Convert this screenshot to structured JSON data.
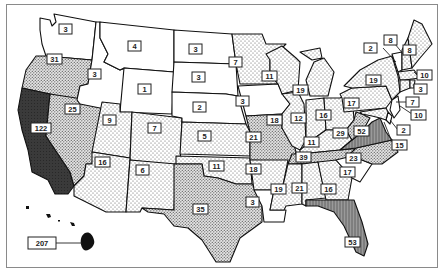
{
  "map": {
    "type": "choropleth",
    "region": "United States",
    "shading_levels": {
      "none": "#ffffff",
      "light": "light dots",
      "medium": "dense dots",
      "dark": "#8a8a8a",
      "darkest": "#333333"
    },
    "states": [
      {
        "abbr": "WA",
        "value": "3"
      },
      {
        "abbr": "OR",
        "value": "31"
      },
      {
        "abbr": "CA",
        "value": "122"
      },
      {
        "abbr": "NV",
        "value": "25"
      },
      {
        "abbr": "ID",
        "value": "3"
      },
      {
        "abbr": "MT",
        "value": "4"
      },
      {
        "abbr": "WY",
        "value": "1"
      },
      {
        "abbr": "UT",
        "value": "9"
      },
      {
        "abbr": "CO",
        "value": "7"
      },
      {
        "abbr": "AZ",
        "value": "16"
      },
      {
        "abbr": "NM",
        "value": "6"
      },
      {
        "abbr": "ND",
        "value": "3"
      },
      {
        "abbr": "SD",
        "value": "3"
      },
      {
        "abbr": "NE",
        "value": "2"
      },
      {
        "abbr": "KS",
        "value": "5"
      },
      {
        "abbr": "OK",
        "value": "11"
      },
      {
        "abbr": "TX",
        "value": "35"
      },
      {
        "abbr": "MN",
        "value": "7"
      },
      {
        "abbr": "IA",
        "value": "3"
      },
      {
        "abbr": "MO",
        "value": "21"
      },
      {
        "abbr": "AR",
        "value": "18"
      },
      {
        "abbr": "LA",
        "value": "3"
      },
      {
        "abbr": "WI",
        "value": "11"
      },
      {
        "abbr": "IL",
        "value": "18"
      },
      {
        "abbr": "MI",
        "value": "19"
      },
      {
        "abbr": "IN",
        "value": "12"
      },
      {
        "abbr": "OH",
        "value": "16"
      },
      {
        "abbr": "KY",
        "value": "11"
      },
      {
        "abbr": "TN",
        "value": "39"
      },
      {
        "abbr": "MS",
        "value": "19"
      },
      {
        "abbr": "AL",
        "value": "21"
      },
      {
        "abbr": "GA",
        "value": "16"
      },
      {
        "abbr": "FL",
        "value": "53"
      },
      {
        "abbr": "SC",
        "value": "17"
      },
      {
        "abbr": "NC",
        "value": "23"
      },
      {
        "abbr": "VA",
        "value": "52"
      },
      {
        "abbr": "WV",
        "value": "29"
      },
      {
        "abbr": "PA",
        "value": "17"
      },
      {
        "abbr": "NY",
        "value": "19"
      },
      {
        "abbr": "VT",
        "value": "2"
      },
      {
        "abbr": "NH",
        "value": "8"
      },
      {
        "abbr": "ME",
        "value": "8"
      },
      {
        "abbr": "MA",
        "value": "10"
      },
      {
        "abbr": "RI",
        "value": "3"
      },
      {
        "abbr": "CT",
        "value": "7"
      },
      {
        "abbr": "NJ",
        "value": "10"
      },
      {
        "abbr": "DE",
        "value": "2"
      },
      {
        "abbr": "MD",
        "value": "15"
      },
      {
        "abbr": "HI",
        "value": "207"
      }
    ]
  },
  "labels": {
    "WA": "3",
    "OR": "31",
    "CA": "122",
    "NV": "25",
    "ID": "3",
    "MT": "4",
    "WY": "1",
    "UT": "9",
    "CO": "7",
    "AZ": "16",
    "NM": "6",
    "ND": "3",
    "SD": "3",
    "NE": "2",
    "KS": "5",
    "OK": "11",
    "TX": "35",
    "MN": "7",
    "IA": "3",
    "MO": "21",
    "AR": "18",
    "LA": "3",
    "WI": "11",
    "IL": "18",
    "MI": "19",
    "IN": "12",
    "OH": "16",
    "KY": "11",
    "TN": "39",
    "MS": "19",
    "AL": "21",
    "GA": "16",
    "FL": "53",
    "SC": "17",
    "NC": "23",
    "VA": "52",
    "WV": "29",
    "PA": "17",
    "NY": "19",
    "VT": "2",
    "NH": "8",
    "ME": "8",
    "MA": "10",
    "RI": "3",
    "CT": "7",
    "NJ": "10",
    "DE": "2",
    "MD": "15",
    "HI": "207"
  }
}
